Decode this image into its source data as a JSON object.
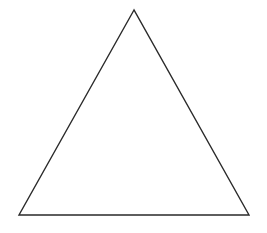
{
  "diagram": {
    "shape": "triangle",
    "kind": "equilateral-outline",
    "vertices": {
      "apex": [
        134,
        10
      ],
      "bottom_left": [
        19,
        215
      ],
      "bottom_right": [
        249,
        215
      ]
    },
    "stroke_color": "#2a2a2a",
    "fill_color": "#ffffff",
    "stroke_width": 1.4,
    "background": "#ffffff"
  }
}
